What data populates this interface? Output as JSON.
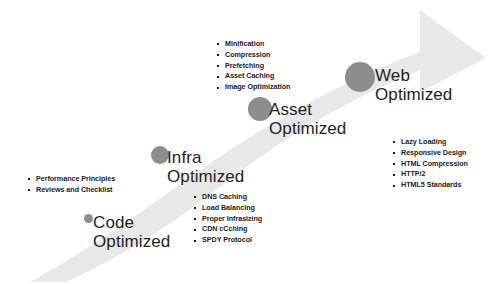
{
  "diagram": {
    "arrow": {
      "name": "upward-curved-arrow",
      "color": "#e8e8e8",
      "direction": "left-to-right-ascending"
    },
    "milestone_color": "#8d8d8d",
    "stages": [
      {
        "id": "code-optimized",
        "label": "Code\nOptimized",
        "dot": {
          "x": 84,
          "y": 214,
          "size": 9
        },
        "label_pos": {
          "x": 93,
          "y": 213,
          "font_size": 17
        },
        "bullets": [
          "Performance Principles",
          "Reviews and Checklist"
        ],
        "bullets_pos": {
          "x": 27,
          "y": 174,
          "font_size": 7.2,
          "line_height": 10.5
        }
      },
      {
        "id": "infra-optimized",
        "label": "Infra\nOptimized",
        "dot": {
          "x": 151,
          "y": 146,
          "size": 18
        },
        "label_pos": {
          "x": 167,
          "y": 148,
          "font_size": 17
        },
        "bullets": [
          "DNS Caching",
          "Load Balancing",
          "Proper Infrasizing",
          "CDN cCching",
          "SPDY Protocol"
        ],
        "bullets_pos": {
          "x": 193,
          "y": 192,
          "font_size": 7.2,
          "line_height": 10.8
        }
      },
      {
        "id": "asset-optimized",
        "label": "Asset\nOptimized",
        "dot": {
          "x": 248,
          "y": 97,
          "size": 24
        },
        "label_pos": {
          "x": 269,
          "y": 100,
          "font_size": 17
        },
        "bullets": [
          "Minification",
          "Compression",
          "Prefetching",
          "Asset Caching",
          "Image Optimization"
        ],
        "bullets_pos": {
          "x": 216,
          "y": 39,
          "font_size": 7.2,
          "line_height": 10.8
        }
      },
      {
        "id": "web-optimized",
        "label": "Web\nOptimized",
        "dot": {
          "x": 345,
          "y": 62,
          "size": 30
        },
        "label_pos": {
          "x": 375,
          "y": 66,
          "font_size": 17
        },
        "bullets": [
          "Lazy Loading",
          "Responsive Design",
          "HTML Compression",
          "HTTP/2",
          "HTML5 Standards"
        ],
        "bullets_pos": {
          "x": 392,
          "y": 137,
          "font_size": 7.2,
          "line_height": 10.8
        }
      }
    ]
  }
}
